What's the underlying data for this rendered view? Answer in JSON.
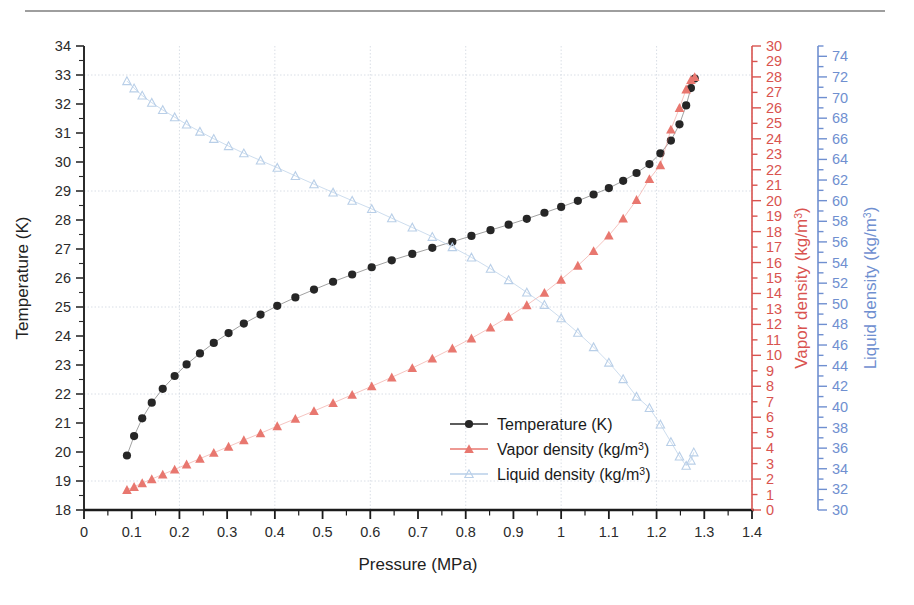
{
  "figure": {
    "rule_above": "horizontal-rule",
    "background": "#ffffff"
  },
  "chart_data": {
    "type": "scatter",
    "title": "",
    "xlabel": "Pressure (MPa)",
    "ylabel": "Temperature (K)",
    "xlim": [
      0,
      1.4
    ],
    "xticks": [
      "0",
      "0.1",
      "0.2",
      "0.3",
      "0.4",
      "0.5",
      "0.6",
      "0.7",
      "0.8",
      "0.9",
      "1",
      "1.1",
      "1.2",
      "1.3",
      "1.4"
    ],
    "xtick_step": 0.1,
    "xminor_step": 0.05,
    "grid": "light dotted gridlines, vertical every 0.2 MPa, horizontal every 4 K",
    "legend_position": "inside lower-right",
    "axes": [
      {
        "id": "left",
        "label": "Temperature (K)",
        "color": "#2b2b2b",
        "lim": [
          18,
          34
        ],
        "tick_step": 1,
        "ticks": [
          "18",
          "19",
          "20",
          "21",
          "22",
          "23",
          "24",
          "25",
          "26",
          "27",
          "28",
          "29",
          "30",
          "31",
          "32",
          "33",
          "34"
        ]
      },
      {
        "id": "right-1",
        "label": "Vapor density (kg/m3)",
        "label_unit_sup": "3",
        "label_base": "Vapor density (kg/m",
        "color": "#d9534f",
        "lim": [
          0,
          30
        ],
        "tick_step": 1,
        "ticks": [
          "0",
          "1",
          "2",
          "3",
          "4",
          "5",
          "6",
          "7",
          "8",
          "9",
          "10",
          "11",
          "12",
          "13",
          "14",
          "15",
          "16",
          "17",
          "18",
          "19",
          "20",
          "21",
          "22",
          "23",
          "24",
          "25",
          "26",
          "27",
          "28",
          "29",
          "30"
        ]
      },
      {
        "id": "right-2",
        "label": "Liquid density (kg/m3)",
        "label_unit_sup": "3",
        "label_base": "Liquid density (kg/m",
        "color": "#6f8fd0",
        "lim": [
          30,
          75
        ],
        "tick_step": 1,
        "label_step": 2,
        "ticks": [
          "30",
          "32",
          "34",
          "36",
          "38",
          "40",
          "42",
          "44",
          "46",
          "48",
          "50",
          "52",
          "54",
          "56",
          "58",
          "60",
          "62",
          "64",
          "66",
          "68",
          "70",
          "72",
          "74"
        ]
      }
    ],
    "series": [
      {
        "name": "Temperature (K)",
        "axis": "left",
        "color": "#262626",
        "marker": "filled-circle",
        "x": [
          0.09,
          0.105,
          0.122,
          0.142,
          0.165,
          0.19,
          0.215,
          0.243,
          0.272,
          0.303,
          0.335,
          0.37,
          0.405,
          0.443,
          0.482,
          0.522,
          0.562,
          0.603,
          0.645,
          0.688,
          0.73,
          0.772,
          0.812,
          0.852,
          0.89,
          0.928,
          0.965,
          1.0,
          1.035,
          1.068,
          1.1,
          1.13,
          1.158,
          1.185,
          1.208,
          1.23,
          1.248,
          1.262,
          1.272,
          1.28
        ],
        "y": [
          19.88,
          20.55,
          21.16,
          21.7,
          22.18,
          22.62,
          23.02,
          23.4,
          23.76,
          24.1,
          24.43,
          24.74,
          25.04,
          25.33,
          25.6,
          25.87,
          26.12,
          26.37,
          26.61,
          26.83,
          27.04,
          27.25,
          27.45,
          27.65,
          27.84,
          28.04,
          28.25,
          28.45,
          28.66,
          28.88,
          29.1,
          29.35,
          29.62,
          29.93,
          30.3,
          30.74,
          31.3,
          31.95,
          32.55,
          32.88
        ]
      },
      {
        "name": "Vapor density (kg/m3)",
        "axis": "right-1",
        "color": "#e8776f",
        "marker": "filled-triangle",
        "x": [
          0.09,
          0.105,
          0.122,
          0.142,
          0.165,
          0.19,
          0.215,
          0.243,
          0.272,
          0.303,
          0.335,
          0.37,
          0.405,
          0.443,
          0.482,
          0.522,
          0.562,
          0.603,
          0.645,
          0.688,
          0.73,
          0.772,
          0.812,
          0.852,
          0.89,
          0.928,
          0.965,
          1.0,
          1.035,
          1.068,
          1.1,
          1.13,
          1.158,
          1.185,
          1.208,
          1.23,
          1.248,
          1.262,
          1.272,
          1.28
        ],
        "y": [
          1.3,
          1.5,
          1.74,
          2.0,
          2.3,
          2.62,
          2.95,
          3.32,
          3.7,
          4.1,
          4.52,
          4.96,
          5.42,
          5.9,
          6.4,
          6.92,
          7.45,
          8.0,
          8.58,
          9.18,
          9.8,
          10.45,
          11.1,
          11.8,
          12.5,
          13.25,
          14.05,
          14.9,
          15.8,
          16.75,
          17.75,
          18.85,
          20.05,
          21.4,
          22.3,
          24.6,
          26.0,
          27.2,
          27.8,
          28.0
        ]
      },
      {
        "name": "Liquid density (kg/m3)",
        "axis": "right-2",
        "color": "#b9cfe8",
        "marker": "open-triangle",
        "x": [
          0.09,
          0.105,
          0.122,
          0.142,
          0.165,
          0.19,
          0.215,
          0.243,
          0.272,
          0.303,
          0.335,
          0.37,
          0.405,
          0.443,
          0.482,
          0.522,
          0.562,
          0.603,
          0.645,
          0.688,
          0.73,
          0.772,
          0.812,
          0.852,
          0.89,
          0.928,
          0.965,
          1.0,
          1.035,
          1.068,
          1.1,
          1.13,
          1.158,
          1.185,
          1.208,
          1.23,
          1.248,
          1.262,
          1.272,
          1.278
        ],
        "y": [
          71.6,
          70.9,
          70.2,
          69.5,
          68.8,
          68.1,
          67.4,
          66.7,
          66.0,
          65.3,
          64.6,
          63.9,
          63.2,
          62.4,
          61.6,
          60.8,
          60.0,
          59.2,
          58.3,
          57.4,
          56.5,
          55.5,
          54.5,
          53.4,
          52.3,
          51.1,
          49.9,
          48.6,
          47.2,
          45.8,
          44.3,
          42.7,
          41.0,
          39.9,
          38.3,
          36.6,
          35.2,
          34.3,
          34.8,
          35.6
        ]
      }
    ],
    "legend": [
      {
        "label": "Temperature (K)",
        "label_base": "Temperature (K)",
        "sup": "",
        "marker": "filled-circle",
        "color": "#262626"
      },
      {
        "label": "Vapor density (kg/m3)",
        "label_base": "Vapor density (kg/m",
        "sup": "3",
        "label_tail": ")",
        "marker": "filled-triangle",
        "color": "#e8776f"
      },
      {
        "label": "Liquid density (kg/m3)",
        "label_base": "Liquid density (kg/m",
        "sup": "3",
        "label_tail": ")",
        "marker": "open-triangle",
        "color": "#b9cfe8"
      }
    ]
  }
}
